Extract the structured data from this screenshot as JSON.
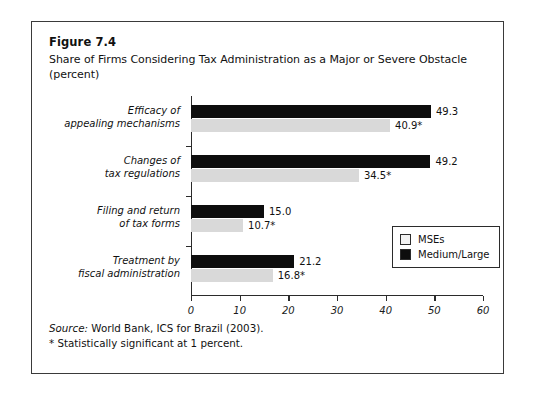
{
  "figure": {
    "number": "Figure 7.4",
    "title": "Share of Firms Considering Tax Administration as a Major or Severe Obstacle (percent)"
  },
  "notes": {
    "source_label": "Source:",
    "source_text": " World Bank, ICS for Brazil (2003).",
    "significance": "* Statistically significant at 1 percent."
  },
  "legend": {
    "items": [
      {
        "label": "MSEs",
        "color": "#f2f2f2"
      },
      {
        "label": "Medium/Large",
        "color": "#0d0d0d"
      }
    ]
  },
  "chart_data": {
    "type": "bar",
    "orientation": "horizontal",
    "title": "Share of Firms Considering Tax Administration as a Major or Severe Obstacle (percent)",
    "xlabel": "",
    "ylabel": "",
    "xlim": [
      0,
      60
    ],
    "xticks": [
      0,
      10,
      20,
      30,
      40,
      50,
      60
    ],
    "xtick_labels": [
      "0",
      "10",
      "20",
      "30",
      "40",
      "50",
      "60"
    ],
    "grid": false,
    "legend_position": "inside-lower-right",
    "categories": [
      "Efficacy of appealing mechanisms",
      "Changes of tax regulations",
      "Filing and return of tax forms",
      "Treatment by fiscal administration"
    ],
    "category_lines": [
      [
        "Efficacy of",
        "appealing mechanisms"
      ],
      [
        "Changes of",
        "tax regulations"
      ],
      [
        "Filing and return",
        "of tax forms"
      ],
      [
        "Treatment by",
        "fiscal administration"
      ]
    ],
    "series": [
      {
        "name": "Medium/Large",
        "color": "#0d0d0d",
        "values": [
          49.3,
          49.2,
          15.0,
          21.2
        ],
        "labels": [
          "49.3",
          "49.2",
          "15.0",
          "21.2"
        ]
      },
      {
        "name": "MSEs",
        "color": "#d9d9d9",
        "values": [
          40.9,
          34.5,
          10.7,
          16.8
        ],
        "labels": [
          "40.9*",
          "34.5*",
          "10.7*",
          "16.8*"
        ]
      }
    ]
  }
}
